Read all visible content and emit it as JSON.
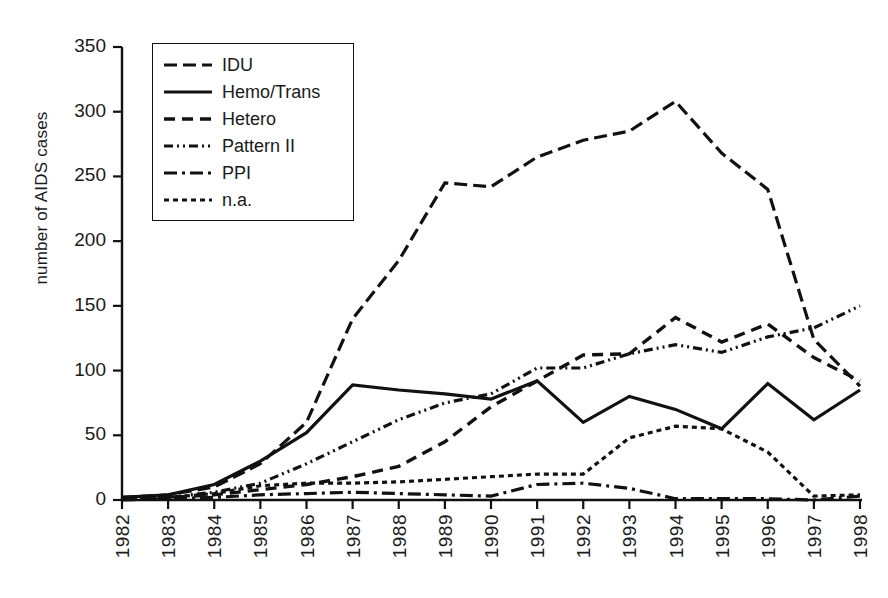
{
  "chart_data": {
    "type": "line",
    "title": "",
    "xlabel": "",
    "ylabel": "number of AIDS cases",
    "x": [
      1982,
      1983,
      1984,
      1985,
      1986,
      1987,
      1988,
      1989,
      1990,
      1991,
      1992,
      1993,
      1994,
      1995,
      1996,
      1997,
      1998
    ],
    "xtick_labels": [
      "1982",
      "1983",
      "1984",
      "1985",
      "1986",
      "1987",
      "1988",
      "1989",
      "1990",
      "1991",
      "1992",
      "1993",
      "1994",
      "1995",
      "1996",
      "1997",
      "1998"
    ],
    "ytick_labels": [
      "0",
      "50",
      "100",
      "150",
      "200",
      "250",
      "300",
      "350"
    ],
    "yticks": [
      0,
      50,
      100,
      150,
      200,
      250,
      300,
      350
    ],
    "ylim": [
      0,
      350
    ],
    "xlim": [
      1982,
      1998
    ],
    "grid": false,
    "legend_position": "upper-left",
    "series": [
      {
        "name": "IDU",
        "style": "long-dash",
        "dasharray": "13,6",
        "width": 3.2,
        "values": [
          2,
          4,
          10,
          28,
          60,
          140,
          185,
          245,
          242,
          265,
          278,
          285,
          308,
          268,
          240,
          124,
          88
        ]
      },
      {
        "name": "Hemo/Trans",
        "style": "solid",
        "dasharray": "none",
        "width": 3.2,
        "values": [
          2,
          4,
          12,
          30,
          52,
          89,
          85,
          82,
          78,
          92,
          60,
          80,
          70,
          55,
          90,
          62,
          85
        ]
      },
      {
        "name": "Hetero",
        "style": "dash",
        "dasharray": "11,7",
        "width": 3.4,
        "values": [
          1,
          2,
          4,
          8,
          12,
          18,
          26,
          45,
          72,
          92,
          112,
          113,
          141,
          122,
          136,
          110,
          92
        ]
      },
      {
        "name": "Pattern II",
        "style": "dash-dot-dot",
        "dasharray": "9,4,2,4,2,4",
        "width": 3.2,
        "values": [
          1,
          2,
          6,
          13,
          28,
          45,
          62,
          75,
          82,
          102,
          102,
          113,
          120,
          114,
          126,
          133,
          150
        ]
      },
      {
        "name": "PPI",
        "style": "dash-dot",
        "dasharray": "13,5,3,5",
        "width": 3.2,
        "values": [
          0,
          1,
          2,
          4,
          5,
          6,
          5,
          4,
          3,
          12,
          13,
          9,
          1,
          1,
          1,
          0,
          3
        ]
      },
      {
        "name": "n.a.",
        "style": "dot",
        "dasharray": "5,4",
        "width": 3.2,
        "values": [
          1,
          2,
          5,
          11,
          13,
          13,
          14,
          16,
          18,
          20,
          20,
          48,
          57,
          55,
          37,
          3,
          4
        ]
      }
    ]
  },
  "axes": {
    "x0": 122,
    "x1": 860,
    "y0": 500,
    "ytop": 47
  },
  "colors": {
    "line": "#111111",
    "axis": "#111111",
    "background": "#ffffff"
  }
}
